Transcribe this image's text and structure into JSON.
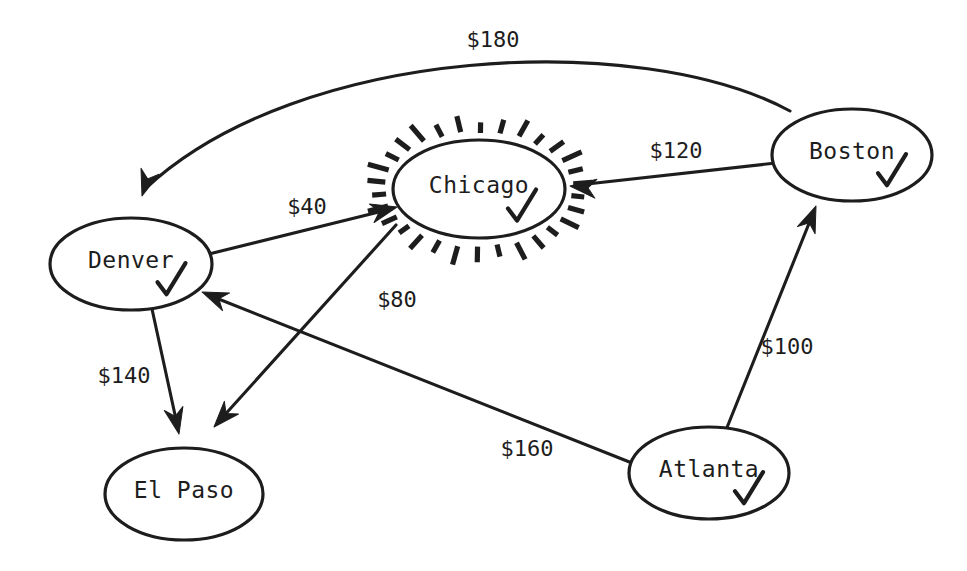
{
  "diagram": {
    "type": "directed-graph",
    "background_color": "#ffffff",
    "ink_color": "#1d1d1d",
    "currency_symbol": "$",
    "nodes": [
      {
        "id": "denver",
        "label": "Denver",
        "cx": 131,
        "cy": 264,
        "rx": 81,
        "ry": 46,
        "visited": true,
        "highlighted": false
      },
      {
        "id": "chicago",
        "label": "Chicago",
        "cx": 479,
        "cy": 189,
        "rx": 86,
        "ry": 49,
        "visited": true,
        "highlighted": true
      },
      {
        "id": "boston",
        "label": "Boston",
        "cx": 852,
        "cy": 155,
        "rx": 80,
        "ry": 46,
        "visited": true,
        "highlighted": false
      },
      {
        "id": "atlanta",
        "label": "Atlanta",
        "cx": 709,
        "cy": 473,
        "rx": 80,
        "ry": 46,
        "visited": true,
        "highlighted": false
      },
      {
        "id": "elpaso",
        "label": "El Paso",
        "cx": 184,
        "cy": 494,
        "rx": 79,
        "ry": 46,
        "visited": false,
        "highlighted": false
      }
    ],
    "edges": [
      {
        "id": "boston-denver",
        "from": "boston",
        "to": "denver",
        "label": "$180",
        "weight": 180,
        "label_x": 493,
        "label_y": 41,
        "curved": true,
        "path": "M 790 111 C 640 30 300 45 146 188",
        "arrow_x": 142,
        "arrow_y": 196,
        "arrow_angle": 108
      },
      {
        "id": "denver-chicago",
        "from": "denver",
        "to": "chicago",
        "label": "$40",
        "weight": 40,
        "label_x": 307,
        "label_y": 208,
        "curved": false,
        "path": "M 209 254 L 391 209",
        "arrow_x": 397,
        "arrow_y": 207,
        "arrow_angle": -14
      },
      {
        "id": "boston-chicago",
        "from": "boston",
        "to": "chicago",
        "label": "$120",
        "weight": 120,
        "label_x": 676,
        "label_y": 152,
        "curved": false,
        "path": "M 776 163 L 578 185",
        "arrow_x": 570,
        "arrow_y": 186,
        "arrow_angle": 186
      },
      {
        "id": "chicago-elpaso",
        "from": "chicago",
        "to": "elpaso",
        "label": "$80",
        "weight": 80,
        "label_x": 397,
        "label_y": 301,
        "curved": false,
        "path": "M 396 225 L 221 419",
        "arrow_x": 214,
        "arrow_y": 427,
        "arrow_angle": 132
      },
      {
        "id": "denver-elpaso",
        "from": "denver",
        "to": "elpaso",
        "label": "$140",
        "weight": 140,
        "label_x": 124,
        "label_y": 377,
        "curved": false,
        "path": "M 152 309 L 177 424",
        "arrow_x": 179,
        "arrow_y": 434,
        "arrow_angle": 78
      },
      {
        "id": "atlanta-denver",
        "from": "atlanta",
        "to": "denver",
        "label": "$160",
        "weight": 160,
        "label_x": 527,
        "label_y": 450,
        "curved": false,
        "path": "M 632 463 L 211 296",
        "arrow_x": 202,
        "arrow_y": 292,
        "arrow_angle": 202
      },
      {
        "id": "atlanta-boston",
        "from": "atlanta",
        "to": "boston",
        "label": "$100",
        "weight": 100,
        "label_x": 787,
        "label_y": 348,
        "curved": false,
        "path": "M 726 430 L 812 216",
        "arrow_x": 816,
        "arrow_y": 206,
        "arrow_angle": -68
      }
    ]
  }
}
